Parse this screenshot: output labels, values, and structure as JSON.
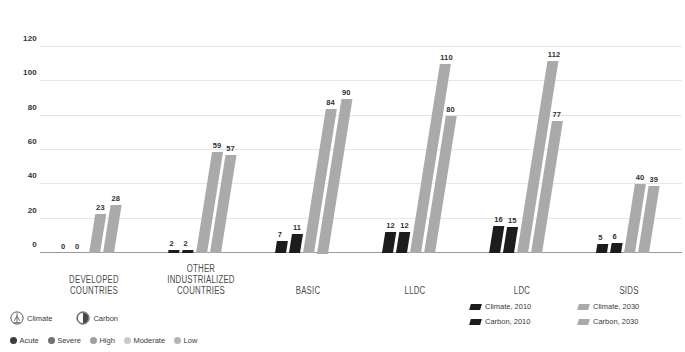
{
  "chart_data": {
    "type": "bar",
    "title": "",
    "subtitle": "",
    "xlabel": "",
    "ylabel": "",
    "ylim": [
      0,
      120
    ],
    "yticks": [
      0,
      20,
      40,
      60,
      80,
      100,
      120
    ],
    "grid": true,
    "legend_position": "bottom-right",
    "categories": [
      "DEVELOPED COUNTRIES",
      "OTHER INDUSTRIALIZED COUNTRIES",
      "BASIC",
      "LLDC",
      "LDC",
      "SIDS"
    ],
    "series": [
      {
        "name": "Climate, 2010",
        "color": "#1c1c1c",
        "values": [
          0,
          2,
          7,
          12,
          16,
          5
        ]
      },
      {
        "name": "Carbon, 2010",
        "color": "#1c1c1c",
        "values": [
          0,
          2,
          11,
          12,
          15,
          6
        ]
      },
      {
        "name": "Climate, 2030",
        "color": "#aaaaaa",
        "values": [
          23,
          59,
          84,
          110,
          112,
          40
        ]
      },
      {
        "name": "Carbon, 2030",
        "color": "#aaaaaa",
        "values": [
          28,
          57,
          90,
          80,
          77,
          39
        ]
      }
    ]
  },
  "series_legend": [
    {
      "label": "Climate, 2010",
      "tone": "dark"
    },
    {
      "label": "Climate, 2030",
      "tone": "gray"
    },
    {
      "label": "Carbon, 2010",
      "tone": "dark"
    },
    {
      "label": "Carbon, 2030",
      "tone": "gray"
    }
  ],
  "icon_legend": [
    {
      "label": "Climate",
      "icon": "climate-icon"
    },
    {
      "label": "Carbon",
      "icon": "carbon-icon"
    }
  ],
  "severity_legend": [
    {
      "label": "Acute",
      "color": "#3d3d3d"
    },
    {
      "label": "Severe",
      "color": "#707070"
    },
    {
      "label": "High",
      "color": "#a0a0a0"
    },
    {
      "label": "Moderate",
      "color": "#c9c9c9"
    },
    {
      "label": "Low",
      "color": "#b4b4b4"
    }
  ]
}
